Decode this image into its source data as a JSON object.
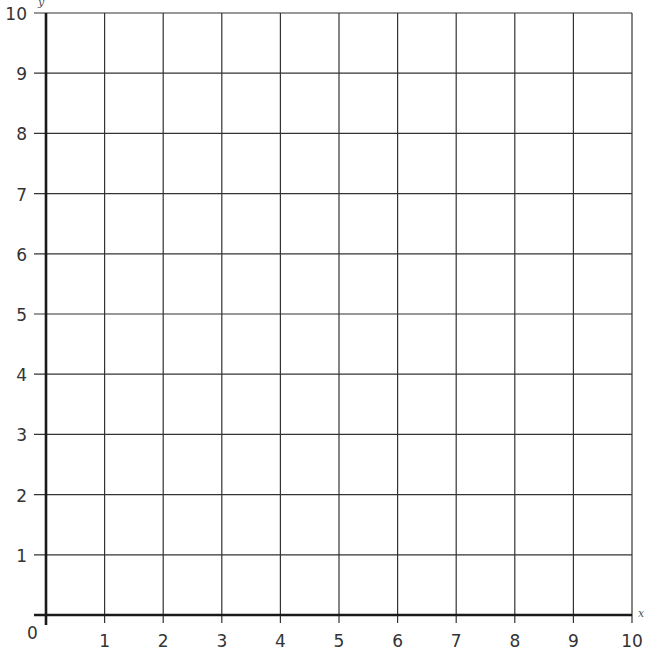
{
  "chart_data": {
    "type": "scatter",
    "title": "",
    "xlabel": "x",
    "ylabel": "y",
    "xlim": [
      0,
      10
    ],
    "ylim": [
      0,
      10
    ],
    "x_ticks": [
      "1",
      "2",
      "3",
      "4",
      "5",
      "6",
      "7",
      "8",
      "9",
      "10"
    ],
    "y_ticks": [
      "1",
      "2",
      "3",
      "4",
      "5",
      "6",
      "7",
      "8",
      "9",
      "10"
    ],
    "origin_label": "0",
    "grid": true,
    "grid_step": 1,
    "series": [],
    "colors": {
      "grid": "#333333",
      "axis": "#1a1a1a",
      "background": "#ffffff"
    }
  },
  "axes": {
    "origin": "0",
    "x_label": "x",
    "y_label": "y"
  }
}
